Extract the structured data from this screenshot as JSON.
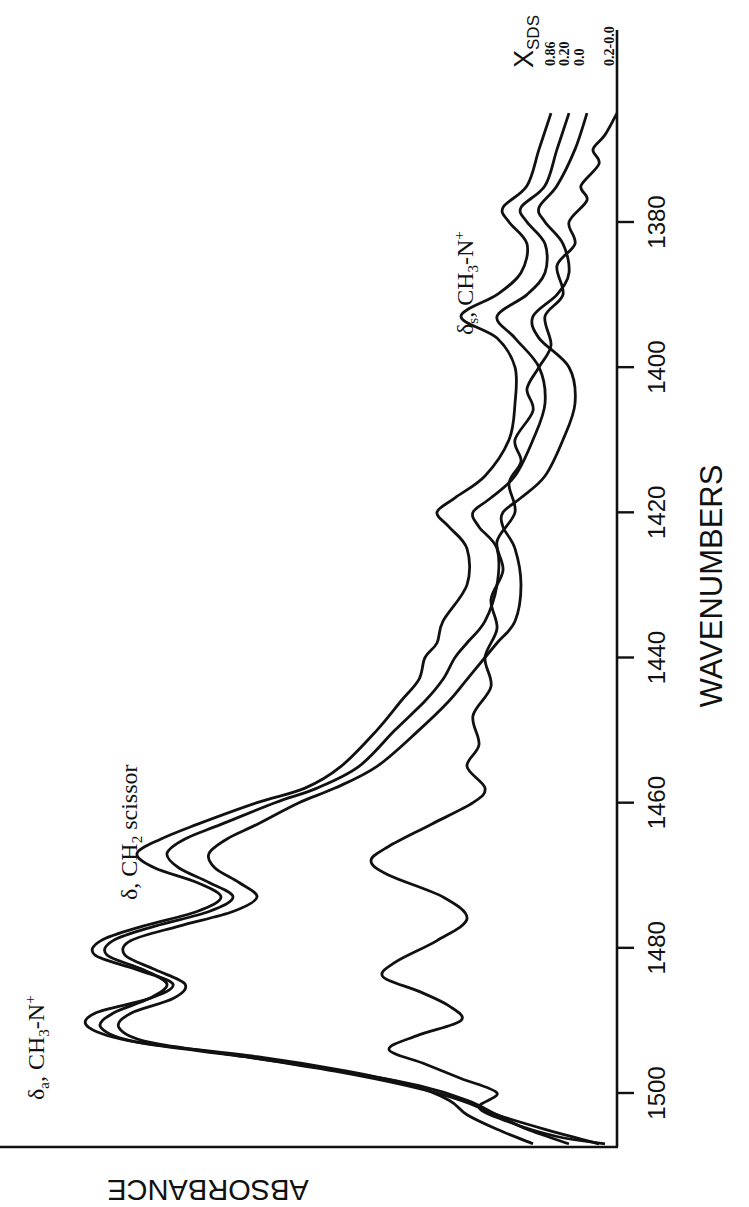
{
  "chart_data": {
    "type": "line",
    "title": "",
    "xlabel": "WAVENUMBERS",
    "ylabel": "ABSORBANCE",
    "orientation": "rotated-90 (wavenumber axis vertical on right, absorbance increases to the left)",
    "xlim": [
      1365,
      1507
    ],
    "x_direction": "decreasing upward",
    "x_ticks": [
      1380,
      1400,
      1420,
      1440,
      1460,
      1480,
      1500
    ],
    "y_ticks": [],
    "ylim": [
      0,
      1
    ],
    "grid": false,
    "legend": {
      "title": "X_SDS",
      "title_main": "X",
      "title_sub": "SDS",
      "position": "top-right, labels at curve ends",
      "entries": [
        "0.86",
        "0.20",
        "0.0",
        "0.2-0.0"
      ]
    },
    "annotations": [
      {
        "text_main": "δ",
        "text_sub": "a",
        "text_rest": ", CH",
        "sub2": "3",
        "tail": "-N",
        "sup": "+",
        "full": "δa, CH3-N+",
        "wavenumber": 1490
      },
      {
        "text_main": "δ",
        "text_rest": ", CH",
        "sub2": "2",
        "tail": " scissor",
        "full": "δ, CH2 scissor",
        "wavenumber": 1467
      },
      {
        "text_main": "δ",
        "text_sub": "s",
        "text_rest": ", CH",
        "sub2": "3",
        "tail": "-N",
        "sup": "+",
        "full": "δs, CH3-N+",
        "wavenumber": 1393
      }
    ],
    "series": [
      {
        "name": "0.86",
        "x": [
          1365,
          1370,
          1375,
          1378,
          1380,
          1383,
          1387,
          1390,
          1393,
          1396,
          1400,
          1405,
          1410,
          1415,
          1418,
          1420,
          1422,
          1425,
          1430,
          1435,
          1438,
          1440,
          1443,
          1446,
          1450,
          1455,
          1458,
          1460,
          1463,
          1465,
          1467,
          1469,
          1471,
          1473,
          1475,
          1477,
          1479,
          1481,
          1483,
          1485,
          1487,
          1489,
          1491,
          1493,
          1495,
          1497,
          1499,
          1501,
          1503,
          1505,
          1507
        ],
        "values": [
          0.11,
          0.13,
          0.15,
          0.19,
          0.18,
          0.15,
          0.16,
          0.2,
          0.26,
          0.2,
          0.17,
          0.17,
          0.18,
          0.22,
          0.27,
          0.3,
          0.28,
          0.25,
          0.25,
          0.29,
          0.3,
          0.32,
          0.33,
          0.36,
          0.4,
          0.46,
          0.52,
          0.6,
          0.7,
          0.76,
          0.8,
          0.77,
          0.7,
          0.66,
          0.7,
          0.79,
          0.86,
          0.87,
          0.8,
          0.74,
          0.78,
          0.87,
          0.88,
          0.8,
          0.6,
          0.45,
          0.34,
          0.28,
          0.25,
          0.2,
          0.14
        ]
      },
      {
        "name": "0.20",
        "x": [
          1365,
          1370,
          1375,
          1378,
          1380,
          1383,
          1387,
          1390,
          1393,
          1396,
          1400,
          1405,
          1410,
          1415,
          1418,
          1420,
          1422,
          1425,
          1430,
          1435,
          1438,
          1440,
          1443,
          1446,
          1450,
          1455,
          1458,
          1460,
          1463,
          1465,
          1467,
          1469,
          1471,
          1473,
          1475,
          1477,
          1479,
          1481,
          1483,
          1485,
          1487,
          1489,
          1491,
          1493,
          1495,
          1497,
          1499,
          1501,
          1503,
          1505,
          1507
        ],
        "values": [
          0.08,
          0.1,
          0.12,
          0.16,
          0.15,
          0.12,
          0.12,
          0.15,
          0.2,
          0.17,
          0.13,
          0.12,
          0.14,
          0.17,
          0.21,
          0.24,
          0.23,
          0.2,
          0.2,
          0.22,
          0.25,
          0.27,
          0.29,
          0.32,
          0.37,
          0.43,
          0.5,
          0.57,
          0.66,
          0.72,
          0.75,
          0.73,
          0.68,
          0.64,
          0.68,
          0.77,
          0.84,
          0.85,
          0.79,
          0.75,
          0.78,
          0.84,
          0.86,
          0.8,
          0.62,
          0.46,
          0.33,
          0.25,
          0.2,
          0.15,
          0.08
        ]
      },
      {
        "name": "0.0",
        "x": [
          1365,
          1370,
          1375,
          1378,
          1380,
          1383,
          1387,
          1390,
          1393,
          1396,
          1400,
          1405,
          1410,
          1415,
          1418,
          1420,
          1422,
          1425,
          1430,
          1435,
          1438,
          1440,
          1443,
          1446,
          1450,
          1455,
          1458,
          1460,
          1463,
          1465,
          1467,
          1469,
          1471,
          1473,
          1475,
          1477,
          1479,
          1481,
          1483,
          1485,
          1487,
          1489,
          1491,
          1493,
          1495,
          1497,
          1499,
          1501,
          1503,
          1505,
          1507
        ],
        "values": [
          0.05,
          0.07,
          0.1,
          0.13,
          0.12,
          0.09,
          0.08,
          0.1,
          0.14,
          0.13,
          0.08,
          0.07,
          0.09,
          0.12,
          0.16,
          0.19,
          0.19,
          0.17,
          0.16,
          0.17,
          0.2,
          0.22,
          0.25,
          0.28,
          0.33,
          0.4,
          0.47,
          0.53,
          0.6,
          0.65,
          0.68,
          0.67,
          0.63,
          0.6,
          0.64,
          0.73,
          0.81,
          0.82,
          0.77,
          0.72,
          0.74,
          0.81,
          0.83,
          0.78,
          0.62,
          0.47,
          0.35,
          0.26,
          0.2,
          0.12,
          0.03
        ]
      },
      {
        "name": "0.2-0.0",
        "x": [
          1365,
          1368,
          1370,
          1372,
          1375,
          1377,
          1380,
          1383,
          1386,
          1390,
          1393,
          1397,
          1400,
          1403,
          1406,
          1410,
          1413,
          1416,
          1420,
          1424,
          1428,
          1432,
          1436,
          1440,
          1444,
          1448,
          1452,
          1455,
          1458,
          1460,
          1463,
          1466,
          1468,
          1470,
          1473,
          1476,
          1479,
          1482,
          1484,
          1486,
          1488,
          1490,
          1492,
          1494,
          1496,
          1498,
          1500,
          1502,
          1504,
          1506,
          1507
        ],
        "values": [
          0.0,
          0.02,
          0.04,
          0.03,
          0.06,
          0.05,
          0.08,
          0.07,
          0.1,
          0.09,
          0.12,
          0.11,
          0.13,
          0.15,
          0.14,
          0.17,
          0.16,
          0.18,
          0.17,
          0.2,
          0.19,
          0.21,
          0.2,
          0.22,
          0.21,
          0.24,
          0.23,
          0.25,
          0.22,
          0.24,
          0.31,
          0.38,
          0.41,
          0.38,
          0.29,
          0.25,
          0.3,
          0.37,
          0.39,
          0.33,
          0.28,
          0.26,
          0.33,
          0.38,
          0.32,
          0.26,
          0.2,
          0.23,
          0.18,
          0.1,
          0.02
        ]
      }
    ]
  },
  "axis": {
    "x_title": "WAVENUMBERS",
    "y_title": "ABSORBANCE",
    "tick_labels": [
      "1380",
      "1400",
      "1420",
      "1440",
      "1460",
      "1480",
      "1500"
    ]
  },
  "legend": {
    "title_main": "X",
    "title_sub": "SDS",
    "labels": [
      "0.86",
      "0.20",
      "0.0",
      "0.2-0.0"
    ]
  },
  "annotations": {
    "a1": {
      "delta": "δ",
      "sub": "a",
      "mid": ", CH",
      "sub2": "3",
      "tail": "-N",
      "sup": "+"
    },
    "a2": {
      "delta": "δ",
      "mid": ", CH",
      "sub2": "2",
      "tail": " scissor"
    },
    "a3": {
      "delta": "δ",
      "sub": "s",
      "mid": ", CH",
      "sub2": "3",
      "tail": "-N",
      "sup": "+"
    }
  },
  "colors": {
    "ink": "#111111",
    "background": "#ffffff"
  }
}
